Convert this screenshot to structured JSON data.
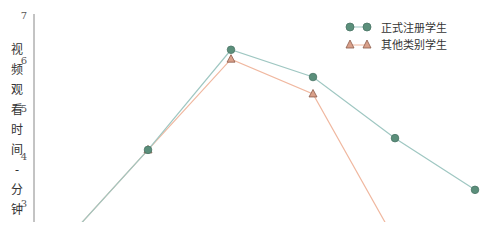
{
  "chart_data": {
    "type": "line",
    "title": "",
    "xlabel": "",
    "ylabel": "视频观看时间 - 分钟",
    "ylim": [
      2.6,
      7
    ],
    "yticks": [
      3,
      4,
      5,
      6,
      7
    ],
    "grid": false,
    "legend_position": "top-right",
    "x": [
      1,
      2,
      3,
      4,
      5,
      6
    ],
    "series": [
      {
        "name": "正式注册学生",
        "marker": "circle",
        "color": "#5b8f7b",
        "line_color": "#9fc7c2",
        "values": [
          2.6,
          4.13,
          6.26,
          5.68,
          4.38,
          3.28
        ]
      },
      {
        "name": "其他类别学生",
        "marker": "triangle",
        "color": "#c98f7a",
        "line_color": "#f0b8a0",
        "values": [
          2.6,
          4.13,
          6.06,
          5.32,
          2.6,
          null
        ]
      }
    ]
  },
  "axis": {
    "ylabel_chars": [
      "视",
      "频",
      "观",
      "看",
      "时",
      "间",
      "-",
      "分",
      "钟"
    ],
    "ticks": [
      "7",
      "6",
      "5",
      "4",
      "3"
    ]
  },
  "legend": {
    "items": [
      {
        "label": "正式注册学生"
      },
      {
        "label": "其他类别学生"
      }
    ]
  }
}
